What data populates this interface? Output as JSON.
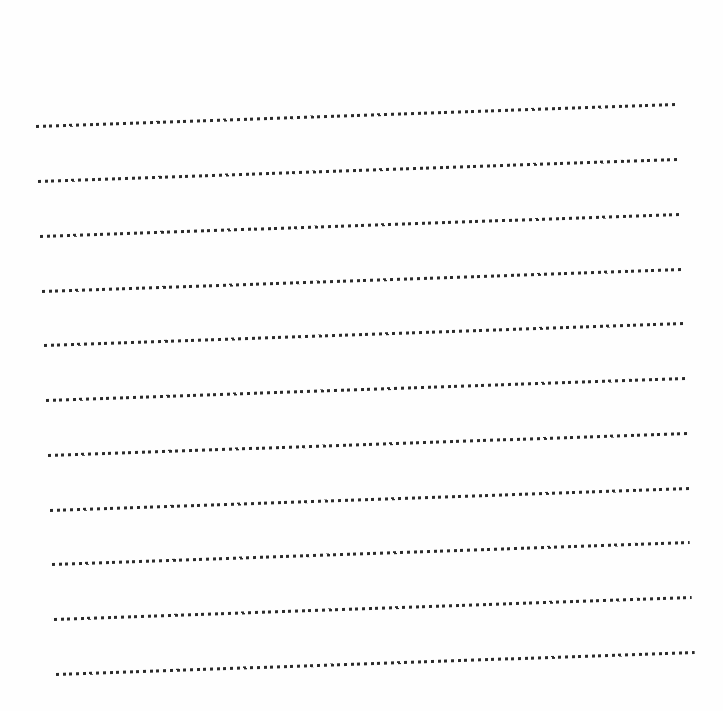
{
  "page": {
    "background": "#fefefe",
    "dot_color": "#2b2b2b",
    "line_count": 11
  },
  "rules": [
    {
      "x1": 36,
      "y1": 126,
      "x2": 676,
      "y2": 104
    },
    {
      "x1": 38,
      "y1": 181,
      "x2": 678,
      "y2": 159
    },
    {
      "x1": 40,
      "y1": 236,
      "x2": 680,
      "y2": 214
    },
    {
      "x1": 42,
      "y1": 291,
      "x2": 682,
      "y2": 269
    },
    {
      "x1": 44,
      "y1": 345,
      "x2": 684,
      "y2": 323
    },
    {
      "x1": 46,
      "y1": 400,
      "x2": 686,
      "y2": 378
    },
    {
      "x1": 48,
      "y1": 455,
      "x2": 688,
      "y2": 433
    },
    {
      "x1": 50,
      "y1": 510,
      "x2": 690,
      "y2": 488
    },
    {
      "x1": 52,
      "y1": 564,
      "x2": 690,
      "y2": 542
    },
    {
      "x1": 54,
      "y1": 619,
      "x2": 692,
      "y2": 597
    },
    {
      "x1": 56,
      "y1": 674,
      "x2": 695,
      "y2": 652
    }
  ]
}
